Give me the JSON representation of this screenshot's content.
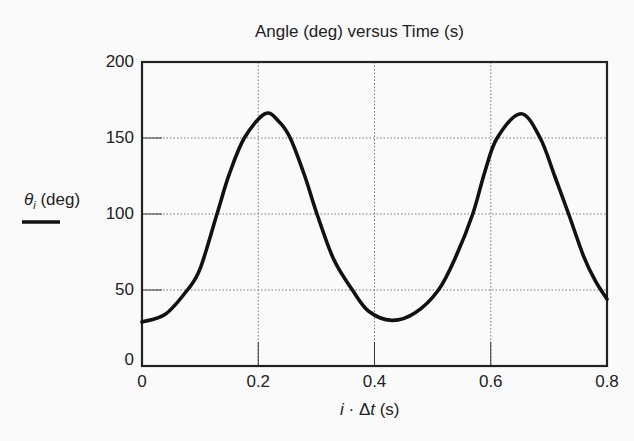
{
  "chart_data": {
    "type": "line",
    "title": "Angle (deg) versus Time (s)",
    "xlabel": "i · Δt (s)",
    "ylabel": "θi (deg)",
    "xlim": [
      0,
      0.8
    ],
    "ylim": [
      0,
      200
    ],
    "x_ticks": [
      "0",
      "0.2",
      "0.4",
      "0.6",
      "0.8"
    ],
    "y_ticks": [
      "0",
      "50",
      "100",
      "150",
      "200"
    ],
    "grid": true,
    "legend": {
      "position": "left",
      "entries": [
        "θi (deg)"
      ]
    },
    "series": [
      {
        "name": "θi (deg)",
        "color": "#111111",
        "x": [
          0,
          0.04,
          0.078,
          0.1,
          0.129,
          0.15,
          0.176,
          0.212,
          0.235,
          0.255,
          0.28,
          0.301,
          0.33,
          0.362,
          0.39,
          0.43,
          0.47,
          0.51,
          0.54,
          0.569,
          0.59,
          0.611,
          0.652,
          0.685,
          0.71,
          0.734,
          0.76,
          0.78,
          0.8
        ],
        "values": [
          29,
          34,
          50,
          64,
          100,
          126,
          150,
          166,
          161,
          150,
          125,
          100,
          70,
          50,
          36,
          30,
          35,
          50,
          72,
          100,
          128,
          150,
          166,
          150,
          125,
          100,
          72,
          56,
          44
        ]
      }
    ]
  }
}
